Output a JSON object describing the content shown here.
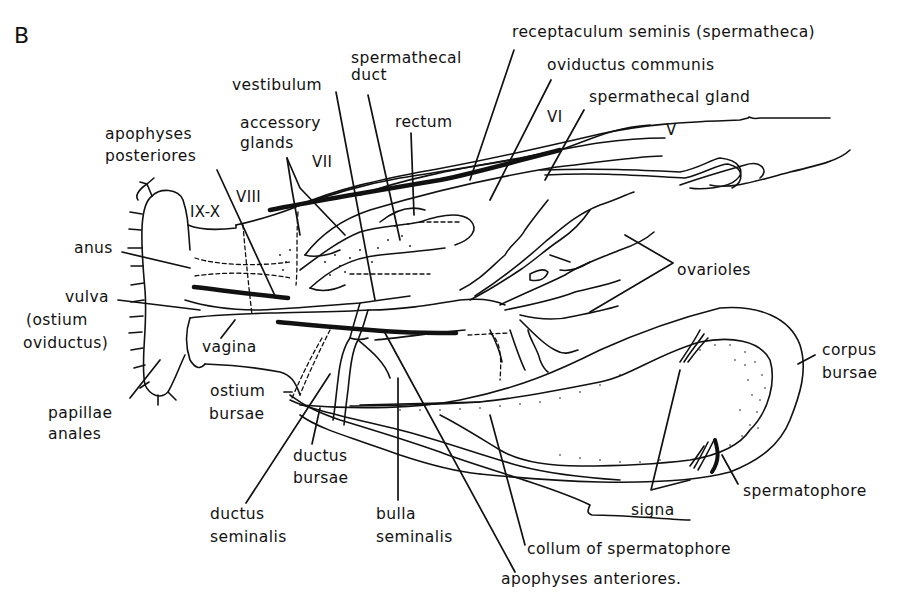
{
  "panel_letter": "B",
  "colors": {
    "ink": "#111111",
    "background": "#ffffff"
  },
  "labels": {
    "receptaculum_seminis": "receptaculum seminis (spermatheca)",
    "spermathecal_duct_1": "spermathecal",
    "spermathecal_duct_2": "duct",
    "oviductus_communis": "oviductus communis",
    "vestibulum": "vestibulum",
    "spermathecal_gland": "spermathecal gland",
    "rectum": "rectum",
    "accessory_glands_1": "accessory",
    "accessory_glands_2": "glands",
    "apophyses_posteriores_1": "apophyses",
    "apophyses_posteriores_2": "posteriores",
    "anus": "anus",
    "vulva_1": "vulva",
    "vulva_2": "(ostium",
    "vulva_3": "oviductus)",
    "vagina": "vagina",
    "ostium_bursae_1": "ostium",
    "ostium_bursae_2": "bursae",
    "papillae_anales_1": "papillae",
    "papillae_anales_2": "anales",
    "ductus_bursae_1": "ductus",
    "ductus_bursae_2": "bursae",
    "ductus_seminalis_1": "ductus",
    "ductus_seminalis_2": "seminalis",
    "bulla_seminalis_1": "bulla",
    "bulla_seminalis_2": "seminalis",
    "ovarioles": "ovarioles",
    "corpus_bursae_1": "corpus",
    "corpus_bursae_2": "bursae",
    "signa": "signa",
    "spermatophore": "spermatophore",
    "collum_of_spermatophore": "collum of spermatophore",
    "apophyses_anteriores": "apophyses anteriores."
  },
  "segments": {
    "v": "V",
    "vi": "VI",
    "vii": "VII",
    "viii": "VIII",
    "ix_x": "IX-X"
  }
}
